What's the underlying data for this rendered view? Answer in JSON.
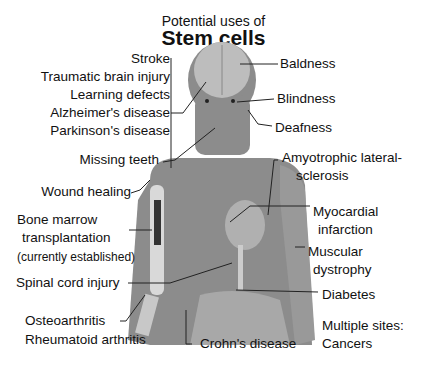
{
  "title": {
    "line1": "Potential uses of",
    "line2": "Stem cells"
  },
  "labels": {
    "stroke": "Stroke",
    "tbi": "Traumatic brain injury",
    "learning": "Learning defects",
    "alzheimers": "Alzheimer's disease",
    "parkinsons": "Parkinson's disease",
    "teeth": "Missing teeth",
    "wound": "Wound healing",
    "bone1": "Bone marrow",
    "bone2": "transplantation",
    "bone3": "(currently established)",
    "spinal": "Spinal cord injury",
    "osteo": "Osteoarthritis",
    "rheum": "Rheumatoid arthritis",
    "crohn": "Crohn's disease",
    "baldness": "Baldness",
    "blindness": "Blindness",
    "deafness": "Deafness",
    "als1": "Amyotrophic lateral-",
    "als2": "sclerosis",
    "mi1": "Myocardial",
    "mi2": "infarction",
    "md1": "Muscular",
    "md2": "dystrophy",
    "diabetes": "Diabetes",
    "multi1": "Multiple sites:",
    "multi2": "Cancers"
  },
  "colors": {
    "body": "#8c8c8c",
    "bone": "#d9d9d9",
    "marrow": "#333333",
    "line": "#222222"
  }
}
